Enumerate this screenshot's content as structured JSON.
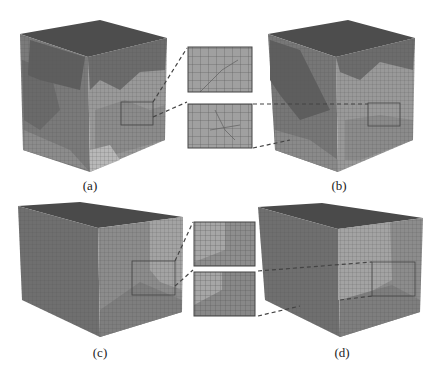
{
  "figure": {
    "panels": [
      {
        "id": "a",
        "label": "(a)",
        "shape": "cube",
        "inset_side": "right"
      },
      {
        "id": "b",
        "label": "(b)",
        "shape": "cube",
        "inset_side": "left"
      },
      {
        "id": "c",
        "label": "(c)",
        "shape": "rectangular-box",
        "inset_side": "right"
      },
      {
        "id": "d",
        "label": "(d)",
        "shape": "rectangular-box",
        "inset_side": "left"
      }
    ],
    "insets": [
      {
        "row": "top",
        "count": 2,
        "description": "magnified mesh region detail"
      },
      {
        "row": "bottom",
        "count": 2,
        "description": "magnified mesh region detail"
      }
    ],
    "colors": {
      "top_face": "#4a4a4a",
      "dark_grain": "#6a6a6a",
      "mid_grain": "#8a8a8a",
      "light_grain": "#a8a8a8",
      "mesh_line": "#555555",
      "inset_border": "#444444"
    }
  }
}
